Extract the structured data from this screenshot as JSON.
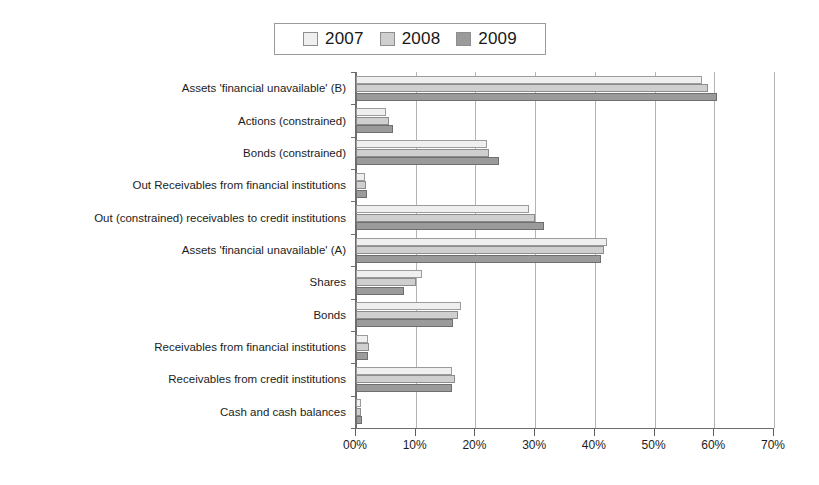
{
  "legend": {
    "position": "top-center",
    "entries": [
      {
        "label": "2007",
        "color": "#efefef",
        "key": "y2007"
      },
      {
        "label": "2008",
        "color": "#cfcfcf",
        "key": "y2008"
      },
      {
        "label": "2009",
        "color": "#9b9b9b",
        "key": "y2009"
      }
    ]
  },
  "chart_data": {
    "type": "bar",
    "orientation": "horizontal",
    "title": "",
    "subtitle": "",
    "xlabel": "",
    "ylabel": "",
    "xlim": [
      0,
      70
    ],
    "grid": true,
    "legend_position": "top-center",
    "xticks": [
      0,
      10,
      20,
      30,
      40,
      50,
      60,
      70
    ],
    "xticklabels": [
      "00%",
      "10%",
      "20%",
      "30%",
      "40%",
      "50%",
      "60%",
      "70%"
    ],
    "categories": [
      "Assets 'financial unavailable' (B)",
      "Actions (constrained)",
      "Bonds (constrained)",
      "Out Receivables from financial institutions",
      "Out (constrained) receivables to credit institutions",
      "Assets 'financial unavailable' (A)",
      "Shares",
      "Bonds",
      "Receivables from financial institutions",
      "Receivables from credit institutions",
      "Cash and cash balances"
    ],
    "series": [
      {
        "name": "2007",
        "color": "#efefef",
        "values": [
          58.0,
          5.0,
          22.0,
          1.5,
          29.0,
          42.0,
          11.0,
          17.5,
          2.0,
          16.0,
          0.8
        ]
      },
      {
        "name": "2008",
        "color": "#cfcfcf",
        "values": [
          59.0,
          5.5,
          22.2,
          1.6,
          30.0,
          41.5,
          10.0,
          17.0,
          2.2,
          16.5,
          0.9
        ]
      },
      {
        "name": "2009",
        "color": "#9b9b9b",
        "values": [
          60.5,
          6.2,
          24.0,
          1.8,
          31.5,
          41.0,
          8.0,
          16.2,
          2.0,
          16.0,
          1.0
        ]
      }
    ]
  }
}
